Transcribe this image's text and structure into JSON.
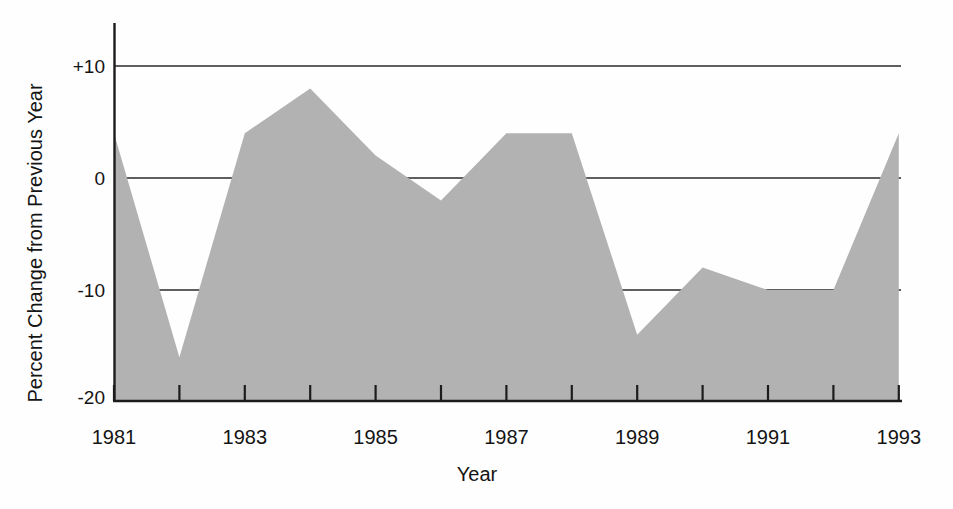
{
  "page": {
    "background_color": "#fefefe"
  },
  "chart_data": {
    "type": "area",
    "title": "",
    "xlabel": "Year",
    "ylabel": "Percent Change from Previous Year",
    "x": [
      1981,
      1982,
      1983,
      1984,
      1985,
      1986,
      1987,
      1988,
      1989,
      1990,
      1991,
      1992,
      1993
    ],
    "values": [
      4,
      -16,
      4,
      8,
      2,
      -2,
      4,
      4,
      -14,
      -8,
      -10,
      -10,
      4
    ],
    "x_tick_years": [
      1981,
      1982,
      1983,
      1984,
      1985,
      1986,
      1987,
      1988,
      1989,
      1990,
      1991,
      1992,
      1993
    ],
    "x_tick_labels": [
      {
        "year": 1981,
        "label": "1981"
      },
      {
        "year": 1983,
        "label": "1983"
      },
      {
        "year": 1985,
        "label": "1985"
      },
      {
        "year": 1987,
        "label": "1987"
      },
      {
        "year": 1989,
        "label": "1989"
      },
      {
        "year": 1991,
        "label": "1991"
      },
      {
        "year": 1993,
        "label": "1993"
      }
    ],
    "y_ticks": [
      {
        "label": "+10",
        "value": 10
      },
      {
        "label": "0",
        "value": 0
      },
      {
        "label": "-10",
        "value": -10
      },
      {
        "label": "-20",
        "value": -20
      }
    ],
    "gridline_values": [
      10,
      0,
      -10
    ],
    "xlim": [
      1981,
      1993
    ],
    "ylim": [
      -20,
      14
    ],
    "grid": "horizontal gridlines at +10, 0, -10; area drawn over gridlines",
    "legend": "none",
    "colors": {
      "area_fill": "#b2b2b2",
      "axis_line": "#1c1c1c",
      "gridline": "#2a2a2a",
      "text": "#141414"
    }
  }
}
